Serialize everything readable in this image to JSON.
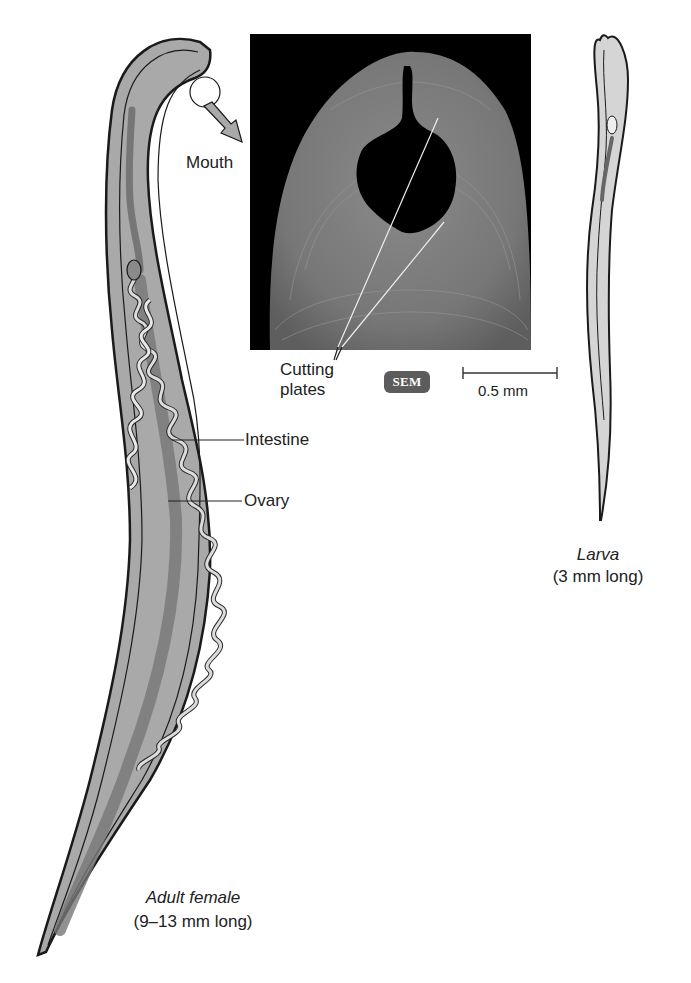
{
  "figure": {
    "labels": {
      "mouth": "Mouth",
      "cutting_plates_line1": "Cutting",
      "cutting_plates_line2": "plates",
      "intestine": "Intestine",
      "ovary": "Ovary"
    },
    "micrograph": {
      "badge": "SEM",
      "scale_bar": "0.5 mm"
    },
    "adult": {
      "title": "Adult female",
      "size": "(9–13 mm long)"
    },
    "larva": {
      "title": "Larva",
      "size": "(3 mm long)"
    },
    "colors": {
      "body_fill": "#a9a9a9",
      "outline": "#1a1a1a",
      "micrograph_bg": "#000000",
      "micrograph_tissue": "#7d7d7d",
      "badge_bg": "#5c5c5c"
    }
  }
}
